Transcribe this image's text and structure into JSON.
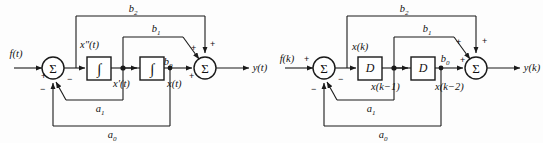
{
  "figure": {
    "background_color": "#fdfdfd",
    "line_color": "#1a1a1a",
    "text_color": "#111111"
  },
  "diagrams": [
    {
      "id": "continuous",
      "name": "continuous-time-block-diagram",
      "input_label": "f(t)",
      "output_label": "y(t)",
      "sum_symbol": "Σ",
      "integrator_symbol": "∫",
      "blocks": [
        {
          "label": "∫",
          "name": "integrator-1"
        },
        {
          "label": "∫",
          "name": "integrator-2"
        }
      ],
      "signals": [
        {
          "label": "x″(t)",
          "name": "second-derivative-signal"
        },
        {
          "label": "x′(t)",
          "name": "first-derivative-signal"
        },
        {
          "label": "x(t)",
          "name": "state-signal"
        }
      ],
      "gains": [
        {
          "label": "b",
          "sub": "2",
          "name": "gain-b2"
        },
        {
          "label": "b",
          "sub": "1",
          "name": "gain-b1"
        },
        {
          "label": "b",
          "sub": "0",
          "name": "gain-b0"
        },
        {
          "label": "a",
          "sub": "1",
          "name": "gain-a1"
        },
        {
          "label": "a",
          "sub": "0",
          "name": "gain-a0"
        }
      ],
      "signs": {
        "input_plus": "+",
        "feedback_a0_minus": "−",
        "feedback_a1_minus": "−",
        "out_b0_plus": "+",
        "out_b1_plus": "+",
        "out_b2_plus": "+"
      }
    },
    {
      "id": "discrete",
      "name": "discrete-time-block-diagram",
      "input_label": "f(k)",
      "output_label": "y(k)",
      "sum_symbol": "Σ",
      "delay_symbol": "D",
      "blocks": [
        {
          "label": "D",
          "name": "delay-1"
        },
        {
          "label": "D",
          "name": "delay-2"
        }
      ],
      "signals": [
        {
          "label": "x(k)",
          "name": "state-signal-k"
        },
        {
          "label": "x(k−1)",
          "name": "state-signal-k-1"
        },
        {
          "label": "x(k−2)",
          "name": "state-signal-k-2"
        }
      ],
      "gains": [
        {
          "label": "b",
          "sub": "2",
          "name": "gain-b2"
        },
        {
          "label": "b",
          "sub": "1",
          "name": "gain-b1"
        },
        {
          "label": "b",
          "sub": "0",
          "name": "gain-b0"
        },
        {
          "label": "a",
          "sub": "1",
          "name": "gain-a1"
        },
        {
          "label": "a",
          "sub": "0",
          "name": "gain-a0"
        }
      ],
      "signs": {
        "input_plus": "+",
        "feedback_a0_minus": "−",
        "feedback_a1_minus": "−",
        "out_b0_plus": "+",
        "out_b1_plus": "+",
        "out_b2_plus": "+"
      }
    }
  ]
}
